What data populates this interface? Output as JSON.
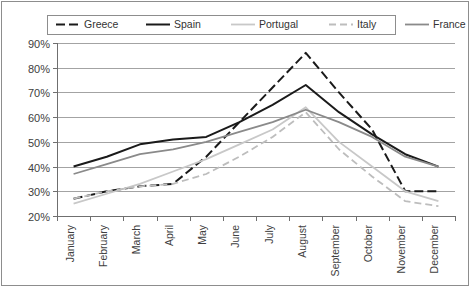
{
  "chart_data": {
    "type": "line",
    "title": "",
    "xlabel": "",
    "ylabel": "",
    "categories": [
      "January",
      "February",
      "March",
      "April",
      "May",
      "June",
      "July",
      "August",
      "September",
      "October",
      "November",
      "December"
    ],
    "ylim": [
      20,
      90
    ],
    "ytick_labels": [
      "20%",
      "30%",
      "40%",
      "50%",
      "60%",
      "70%",
      "80%",
      "90%"
    ],
    "ytick_values": [
      20,
      30,
      40,
      50,
      60,
      70,
      80,
      90
    ],
    "grid": "horizontal",
    "legend_position": "top",
    "series": [
      {
        "name": "Greece",
        "color": "#1a1a1a",
        "width": 2.0,
        "dash": "9,4",
        "values": [
          27,
          30,
          32,
          33,
          44,
          58,
          72,
          86,
          70,
          55,
          30,
          30
        ]
      },
      {
        "name": "Spain",
        "color": "#1a1a1a",
        "width": 2.0,
        "dash": "none",
        "values": [
          40,
          44,
          49,
          51,
          52,
          58,
          65,
          73,
          62,
          53,
          45,
          40
        ]
      },
      {
        "name": "Portugal",
        "color": "#c8c8c8",
        "width": 1.8,
        "dash": "none",
        "values": [
          25,
          29,
          33,
          38,
          43,
          49,
          55,
          64,
          50,
          40,
          30,
          26
        ]
      },
      {
        "name": "Italy",
        "color": "#bdbdbd",
        "width": 1.8,
        "dash": "7,4",
        "values": [
          27,
          30,
          32,
          33,
          37,
          44,
          52,
          62,
          47,
          36,
          26,
          24
        ]
      },
      {
        "name": "France",
        "color": "#8a8a8a",
        "width": 1.8,
        "dash": "none",
        "values": [
          37,
          41,
          45,
          47,
          50,
          54,
          58,
          63,
          58,
          52,
          44,
          40
        ]
      }
    ]
  },
  "legend": {
    "entries": [
      {
        "label": "Greece"
      },
      {
        "label": "Spain"
      },
      {
        "label": "Portugal"
      },
      {
        "label": "Italy"
      },
      {
        "label": "France"
      }
    ]
  }
}
